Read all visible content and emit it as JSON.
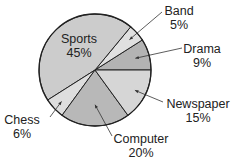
{
  "chart_data": {
    "type": "pie",
    "title": "",
    "categories": [
      "Drama",
      "Band",
      "Sports",
      "Chess",
      "Computer",
      "Newspaper"
    ],
    "values": [
      9,
      5,
      45,
      6,
      20,
      15
    ],
    "unit": "%",
    "legend": "none (callout labels)",
    "colors": [
      "#b3b3b3",
      "#e0e0e0",
      "#cccccc",
      "#dedede",
      "#b8b8b8",
      "#d6d6d6"
    ]
  },
  "labels": {
    "sports": {
      "name": "Sports",
      "pct": "45%"
    },
    "band": {
      "name": "Band",
      "pct": "5%"
    },
    "drama": {
      "name": "Drama",
      "pct": "9%"
    },
    "newspaper": {
      "name": "Newspaper",
      "pct": "15%"
    },
    "computer": {
      "name": "Computer",
      "pct": "20%"
    },
    "chess": {
      "name": "Chess",
      "pct": "6%"
    }
  }
}
